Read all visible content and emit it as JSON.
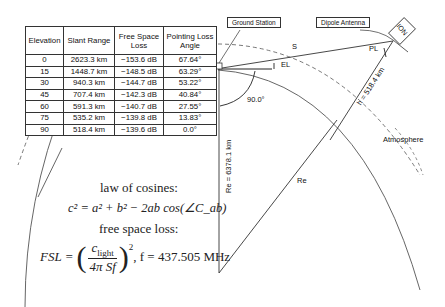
{
  "table": {
    "headers": [
      "Elevation",
      "Slant Range",
      "Free Space Loss",
      "Pointing Loss Angle"
    ],
    "rows": [
      [
        "0",
        "2623.3 km",
        "−153.6 dB",
        "67.64°"
      ],
      [
        "15",
        "1448.7 km",
        "−148.5 dB",
        "63.29°"
      ],
      [
        "30",
        "940.3 km",
        "−144.7 dB",
        "53.22°"
      ],
      [
        "45",
        "707.4 km",
        "−142.3 dB",
        "40.84°"
      ],
      [
        "60",
        "591.3 km",
        "−140.7 dB",
        "27.55°"
      ],
      [
        "75",
        "535.2 km",
        "−139.8 dB",
        "13.83°"
      ],
      [
        "90",
        "518.4 km",
        "−139.6 dB",
        "0.0°"
      ]
    ]
  },
  "labels": {
    "ground_station": "Ground Station",
    "dipole_antenna": "Dipole Antenna",
    "satellite": "ION",
    "slant": "S",
    "elevation": "EL",
    "pointing_loss": "PL",
    "altitude": "h = 518.4 km",
    "angle_90": "90.0°",
    "earth_radius_vertical": "Re = 6378.1 km",
    "earth_radius": "Re",
    "atmosphere": "Atmosphere"
  },
  "equations": {
    "law_of_cosines_title": "law of cosines:",
    "law_of_cosines": "c² = a² + b² − 2ab cos(∠C_ab)",
    "free_space_loss_title": "free space loss:",
    "free_space_loss_lhs": "FSL =",
    "numerator": "c",
    "numerator_sub": "light",
    "denominator": "4π Sf",
    "exponent": "2",
    "frequency": ", f = 437.505 MHz"
  }
}
